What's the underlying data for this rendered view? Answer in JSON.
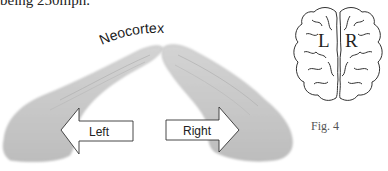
{
  "text": {
    "top_line": "being 250mph."
  },
  "hands_figure": {
    "neocortex_label": "Neocortex",
    "left_arrow_label": "Left",
    "right_arrow_label": "Right"
  },
  "brain_figure": {
    "left_hemisphere_label": "L",
    "right_hemisphere_label": "R",
    "caption": "Fig. 4"
  },
  "colors": {
    "hand_fill": "#c9c9c9",
    "hand_shade": "#b5b5b5",
    "arrow_fill": "#ffffff",
    "arrow_stroke": "#333333",
    "brain_stroke": "#333333"
  }
}
